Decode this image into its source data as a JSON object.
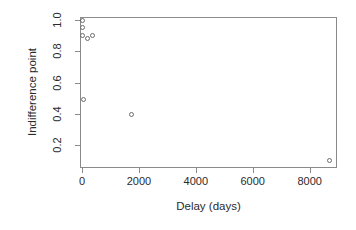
{
  "chart_data": {
    "type": "scatter",
    "title": "",
    "xlabel": "Delay (days)",
    "ylabel": "Indifference point",
    "xlim": [
      -70,
      8960
    ],
    "ylim": [
      0.055,
      1.02
    ],
    "grid": false,
    "legend": null,
    "marker": "open-circle",
    "marker_color": "#6d6d6d",
    "xticks": [
      0,
      2000,
      4000,
      6000,
      8000
    ],
    "xtick_labels": [
      "0",
      "2000",
      "4000",
      "6000",
      "8000"
    ],
    "yticks": [
      0.2,
      0.4,
      0.6,
      0.8,
      1.0
    ],
    "ytick_labels": [
      "0.2",
      "0.4",
      "0.6",
      "0.8",
      "1.0"
    ],
    "series": [
      {
        "name": "Indifference points",
        "points": [
          {
            "x": 7,
            "y": 1.0
          },
          {
            "x": 7,
            "y": 0.955
          },
          {
            "x": 7,
            "y": 0.9
          },
          {
            "x": 180,
            "y": 0.885
          },
          {
            "x": 365,
            "y": 0.9
          },
          {
            "x": 60,
            "y": 0.49
          },
          {
            "x": 1750,
            "y": 0.4
          },
          {
            "x": 8700,
            "y": 0.1
          }
        ]
      }
    ]
  },
  "axes": {
    "x_title": "Delay (days)",
    "y_title": "Indifference point"
  }
}
